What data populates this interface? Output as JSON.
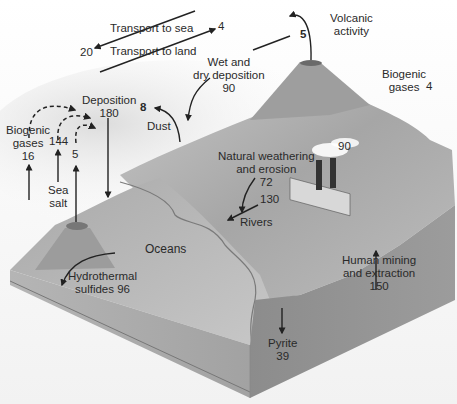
{
  "diagram": {
    "colors": {
      "ocean_top": "#b9b9b9",
      "land_top": "#a8a8a8",
      "block_front": "#9a9a9a",
      "block_side": "#8e8e8e",
      "arrow": "#222222",
      "text": "#2a2a2a"
    },
    "labels": {
      "transport_to_sea": {
        "text": "Transport to sea",
        "value": "4"
      },
      "transport_to_land": {
        "text": "Transport to land",
        "value": "20"
      },
      "volcanic": {
        "line1": "Volcanic",
        "line2": "activity",
        "value": "5"
      },
      "wet_dry": {
        "line1": "Wet and",
        "line2": "dry deposition",
        "value": "90"
      },
      "biogenic_land": {
        "line1": "Biogenic",
        "line2": "gases",
        "value": "4"
      },
      "deposition": {
        "line1": "Deposition",
        "value": "180"
      },
      "dust": {
        "text": "Dust",
        "value": "8"
      },
      "biogenic_sea": {
        "line1": "Biogenic",
        "line2": "gases",
        "value": "16"
      },
      "sea_salt": {
        "line1": "Sea",
        "line2": "salt",
        "value": "144"
      },
      "sea_volcano": {
        "value": "5"
      },
      "industry": {
        "value": "90"
      },
      "weathering": {
        "line1": "Natural weathering",
        "line2": "and erosion",
        "value": "72"
      },
      "rivers": {
        "text": "Rivers",
        "value": "130"
      },
      "oceans": {
        "text": "Oceans"
      },
      "hydrothermal": {
        "line1": "Hydrothermal",
        "line2": "sulfides 96"
      },
      "mining": {
        "line1": "Human mining",
        "line2": "and extraction",
        "value": "150"
      },
      "pyrite": {
        "text": "Pyrite",
        "value": "39"
      }
    }
  }
}
